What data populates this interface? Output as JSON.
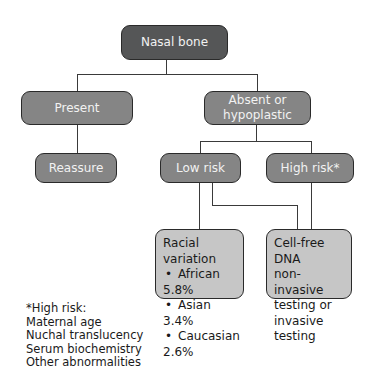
{
  "diagram": {
    "root": {
      "label": "Nasal bone"
    },
    "present": {
      "label": "Present"
    },
    "absent": {
      "label_line1": "Absent or",
      "label_line2": "hypoplastic"
    },
    "reassure": {
      "label": "Reassure"
    },
    "low_risk": {
      "label": "Low risk"
    },
    "high_risk": {
      "label": "High risk*"
    },
    "racial_variation": {
      "title": "Racial variation",
      "items": [
        "African 5.8%",
        "Asian 3.4%",
        "Caucasian 2.6%"
      ]
    },
    "testing": {
      "lines": [
        "Cell-free DNA",
        "non-invasive",
        "testing or",
        "invasive testing"
      ]
    }
  },
  "footnote": {
    "title": "*High risk:",
    "items": [
      "Maternal age",
      "Nuchal translucency",
      "Serum biochemistry",
      "Other abnormalities"
    ]
  },
  "colors": {
    "dark_box": "#555657",
    "mid_box": "#858585",
    "light_box": "#c6c6c6",
    "line": "#3a3a3a"
  }
}
